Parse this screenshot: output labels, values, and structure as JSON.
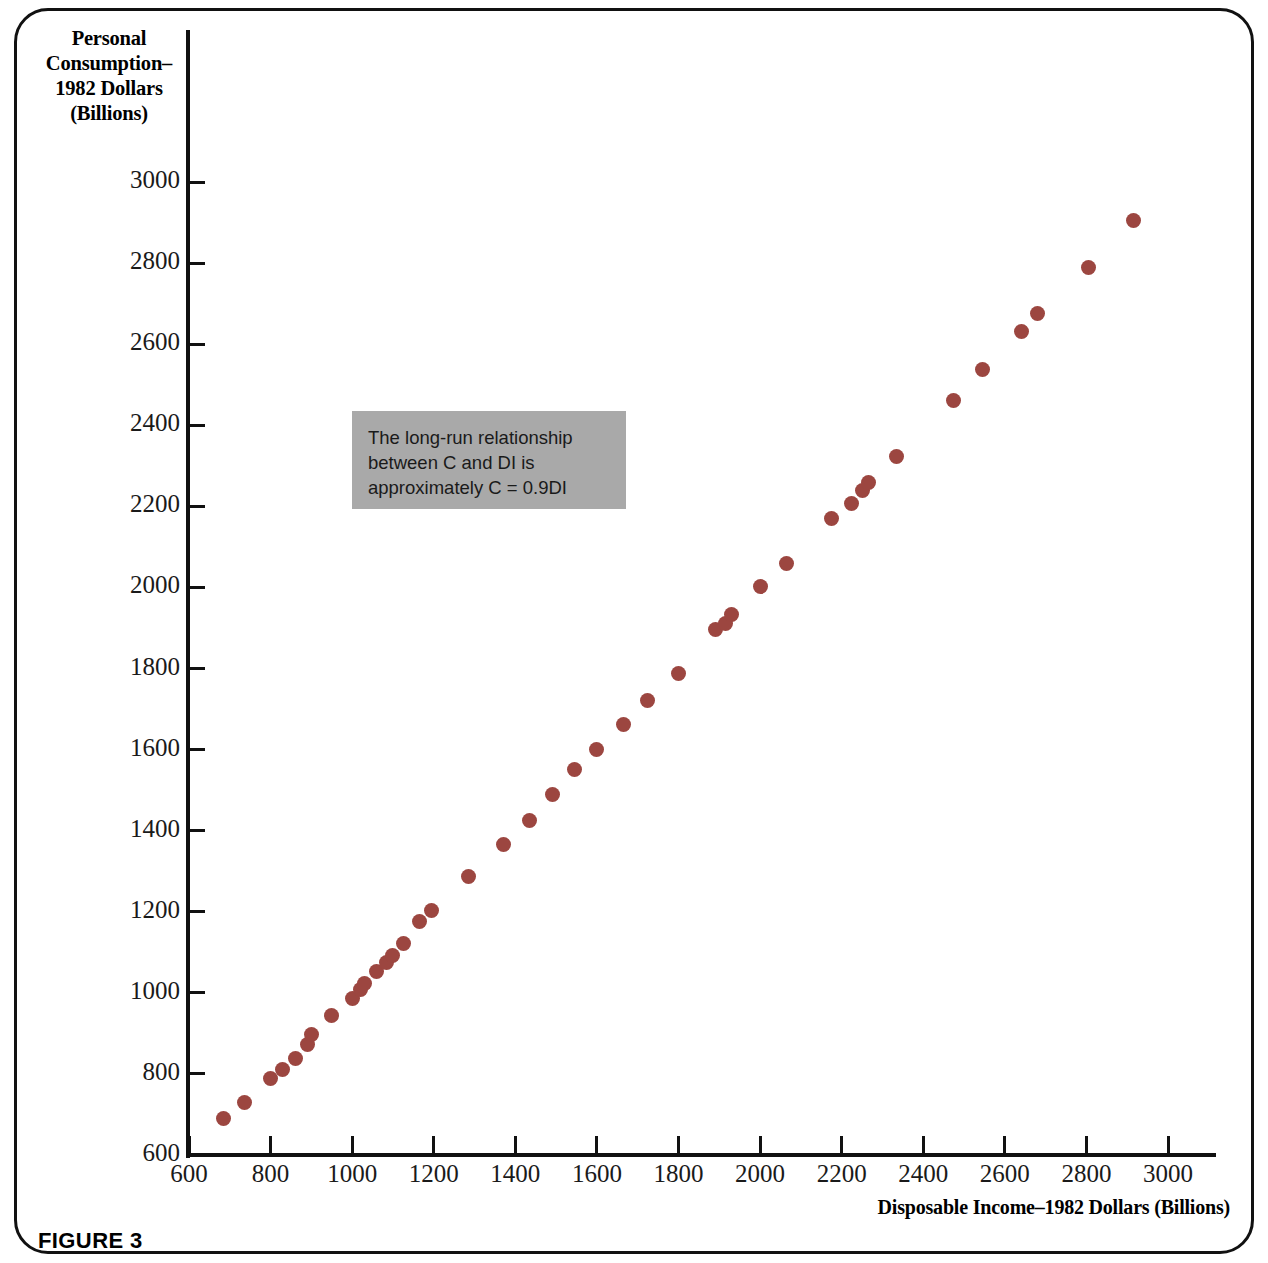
{
  "figure": {
    "caption": "FIGURE 3"
  },
  "annotation": {
    "text": "The long-run relationship between C and DI is approximately C = 0.9DI",
    "background_color": "#a9a9a9"
  },
  "chart_data": {
    "type": "scatter",
    "title": "",
    "xlabel": "Disposable Income–1982 Dollars (Billions)",
    "ylabel": "Personal Consumption–1982 Dollars (Billions)",
    "ylabel_lines": [
      "Personal",
      "Consumption–",
      "1982 Dollars",
      "(Billions)"
    ],
    "xlim": [
      600,
      3100
    ],
    "ylim": [
      600,
      3050
    ],
    "xticks": [
      600,
      800,
      1000,
      1200,
      1400,
      1600,
      1800,
      2000,
      2200,
      2400,
      2600,
      2800,
      3000
    ],
    "yticks": [
      600,
      800,
      1000,
      1200,
      1400,
      1600,
      1800,
      2000,
      2200,
      2400,
      2600,
      2800,
      3000
    ],
    "grid": false,
    "legend": null,
    "marker_color": "#9c4640",
    "marker_size": 15,
    "series": [
      {
        "name": "Consumption vs Disposable Income",
        "points": [
          [
            685,
            690
          ],
          [
            735,
            730
          ],
          [
            800,
            788
          ],
          [
            830,
            812
          ],
          [
            860,
            838
          ],
          [
            890,
            872
          ],
          [
            900,
            898
          ],
          [
            950,
            945
          ],
          [
            1000,
            985
          ],
          [
            1020,
            1008
          ],
          [
            1030,
            1022
          ],
          [
            1060,
            1052
          ],
          [
            1085,
            1075
          ],
          [
            1100,
            1092
          ],
          [
            1125,
            1122
          ],
          [
            1165,
            1175
          ],
          [
            1195,
            1202
          ],
          [
            1285,
            1288
          ],
          [
            1370,
            1365
          ],
          [
            1435,
            1425
          ],
          [
            1490,
            1490
          ],
          [
            1545,
            1552
          ],
          [
            1600,
            1600
          ],
          [
            1665,
            1662
          ],
          [
            1725,
            1720
          ],
          [
            1800,
            1788
          ],
          [
            1890,
            1895
          ],
          [
            1915,
            1912
          ],
          [
            1930,
            1932
          ],
          [
            2000,
            2002
          ],
          [
            2065,
            2058
          ],
          [
            2175,
            2170
          ],
          [
            2225,
            2208
          ],
          [
            2250,
            2240
          ],
          [
            2265,
            2258
          ],
          [
            2335,
            2322
          ],
          [
            2475,
            2462
          ],
          [
            2545,
            2538
          ],
          [
            2640,
            2632
          ],
          [
            2680,
            2675
          ],
          [
            2805,
            2788
          ],
          [
            2915,
            2905
          ]
        ]
      }
    ]
  }
}
